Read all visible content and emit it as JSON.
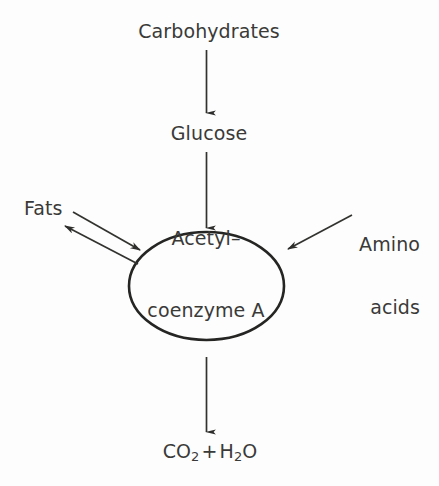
{
  "diagram": {
    "background_color": "#fdfdfd",
    "ink_color": "#3a3a38",
    "width": 439,
    "height": 486
  },
  "nodes": {
    "carbohydrates": {
      "label": "Carbohydrates",
      "role": "input-substrate",
      "position": "top-center"
    },
    "glucose": {
      "label": "Glucose",
      "role": "intermediate",
      "position": "upper-center"
    },
    "fats": {
      "label": "Fats",
      "role": "reversible-substrate",
      "position": "left"
    },
    "amino_acids": {
      "label_line_1": "Amino",
      "label_line_2": "acids",
      "role": "input-substrate",
      "position": "right"
    },
    "acetyl_coa": {
      "label_line_1": "Acetyl–",
      "label_line_2": "coenzyme A",
      "role": "central-hub",
      "shape": "ellipse",
      "position": "center"
    },
    "products": {
      "formula_part_1": "CO",
      "formula_sub_1": "2",
      "operator": "+",
      "formula_part_2": "H",
      "formula_sub_2": "2",
      "formula_part_3": "O",
      "plain_text": "CO2 + H2O",
      "role": "output-products",
      "position": "bottom-center"
    }
  },
  "arrows": [
    {
      "name": "carbohydrates-to-glucose",
      "from": "carbohydrates",
      "to": "glucose",
      "direction": "down",
      "style": "single-headed"
    },
    {
      "name": "glucose-to-acetyl-coa",
      "from": "glucose",
      "to": "acetyl_coa",
      "direction": "down",
      "style": "single-headed"
    },
    {
      "name": "fats-to-acetyl-coa",
      "from": "fats",
      "to": "acetyl_coa",
      "direction": "down-right",
      "style": "single-headed"
    },
    {
      "name": "acetyl-coa-to-fats",
      "from": "acetyl_coa",
      "to": "fats",
      "direction": "up-left",
      "style": "single-headed"
    },
    {
      "name": "amino-acids-to-acetyl-coa",
      "from": "amino_acids",
      "to": "acetyl_coa",
      "direction": "down-left",
      "style": "single-headed"
    },
    {
      "name": "acetyl-coa-to-products",
      "from": "acetyl_coa",
      "to": "products",
      "direction": "down",
      "style": "single-headed"
    }
  ]
}
